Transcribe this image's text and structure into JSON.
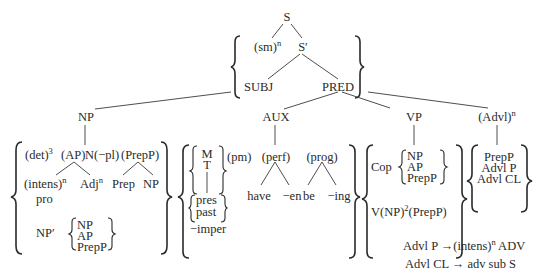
{
  "diagram": {
    "root": {
      "label": "S"
    },
    "level1": {
      "sm": "(sm)",
      "sm_sup": "n",
      "s_prime": "S′"
    },
    "level2": {
      "subj": "SUBJ",
      "pred": "PRED"
    },
    "constituents": {
      "np": {
        "label": "NP",
        "row1": {
          "det": "(det)",
          "det_sup": "3",
          "ap": "(AP)",
          "n_pl": "N(−pl)",
          "prepp": "(PrepP)"
        },
        "row2": {
          "intens": "(intens)",
          "intens_sup": "n",
          "adj": "Adj",
          "adj_sup": "n",
          "prep": "Prep",
          "np": "NP"
        },
        "pro": "pro",
        "np_prime": "NP′",
        "np_prime_options": [
          "NP",
          "AP",
          "PrepP"
        ]
      },
      "aux": {
        "label": "AUX",
        "mt": [
          "M",
          "T"
        ],
        "tense": [
          "pres",
          "past"
        ],
        "imper": "−imper",
        "pm": "(pm)",
        "perf": "(perf)",
        "perf_children": [
          "have",
          "−en"
        ],
        "prog": "(prog)",
        "prog_children": [
          "be",
          "−ing"
        ]
      },
      "vp": {
        "label": "VP",
        "cop": "Cop",
        "cop_options": [
          "NP",
          "AP",
          "PrepP"
        ],
        "v_row": {
          "v_np": "V(NP)",
          "sup": "2",
          "prepp": "(PrepP)"
        }
      },
      "advl": {
        "label": "(Advl)",
        "label_sup": "n",
        "options": [
          "PrepP",
          "Advl P",
          "Advl CL"
        ]
      }
    },
    "rules": [
      {
        "lhs": "Advl P",
        "arrow": "→",
        "rhs": "(intens)",
        "rhs_sup": "n",
        "rhs_tail": " ADV"
      },
      {
        "lhs": "Advl CL",
        "arrow": "→",
        "rhs": "adv sub S",
        "rhs_sup": "",
        "rhs_tail": ""
      }
    ]
  }
}
